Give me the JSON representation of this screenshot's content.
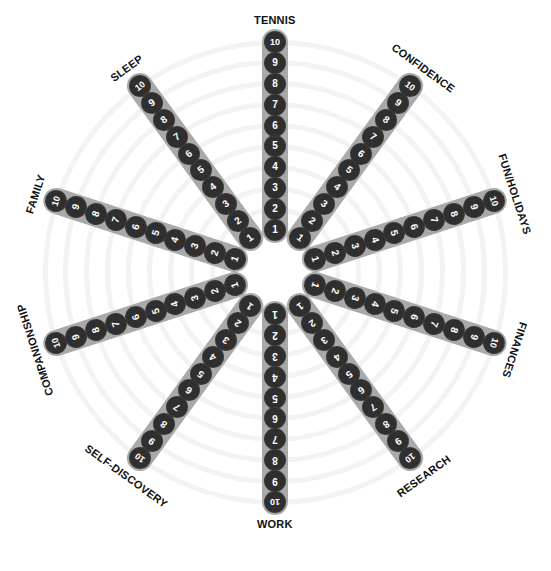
{
  "wheel": {
    "center": [
      275,
      272
    ],
    "inner_radius": 42,
    "outer_radius": 230,
    "label_radius": 252,
    "scale": [
      "1",
      "2",
      "3",
      "4",
      "5",
      "6",
      "7",
      "8",
      "9",
      "10"
    ],
    "colors": {
      "track": "#a9a9a9",
      "dot": "#2f2f2f",
      "dot_text": "#ffffff",
      "ring": "#f3f3f3",
      "label": "#111111"
    },
    "spokes": [
      {
        "label": "TENNIS",
        "bearing": 0,
        "label_rotation": 0
      },
      {
        "label": "CONFIDENCE",
        "bearing": 36,
        "label_rotation": 36
      },
      {
        "label": "FUN/HOLIDAYS",
        "bearing": 72,
        "label_rotation": 72
      },
      {
        "label": "FINANCES",
        "bearing": 108,
        "label_rotation": 108
      },
      {
        "label": "RESEARCH",
        "bearing": 144,
        "label_rotation": -36
      },
      {
        "label": "WORK",
        "bearing": 180,
        "label_rotation": 0
      },
      {
        "label": "SELF-DISCOVERY",
        "bearing": 216,
        "label_rotation": 36
      },
      {
        "label": "COMPANIONSHIP",
        "bearing": 252,
        "label_rotation": -108
      },
      {
        "label": "FAMILY",
        "bearing": 288,
        "label_rotation": -72
      },
      {
        "label": "SLEEP",
        "bearing": 324,
        "label_rotation": -36
      }
    ]
  }
}
